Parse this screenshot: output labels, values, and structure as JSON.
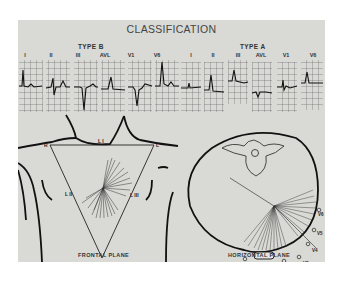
{
  "figure": {
    "title": "CLASSIFICATION",
    "type_b": {
      "label": "TYPE B",
      "leads": [
        "I",
        "II",
        "III",
        "AVL",
        "V1",
        "V6"
      ]
    },
    "type_a": {
      "label": "TYPE A",
      "leads": [
        "I",
        "II",
        "III",
        "AVL",
        "V1",
        "V6"
      ]
    },
    "frontal_plane": {
      "label": "FRONTAL PLANE",
      "vertex_labels": {
        "right": "R",
        "left": "L",
        "foot": "VF"
      },
      "side_labels": {
        "top": "L I",
        "left": "L II",
        "right": "L III"
      }
    },
    "horizontal_plane": {
      "label": "HORIZONTAL PLANE",
      "electrodes": [
        "V1",
        "V2",
        "V3",
        "V4",
        "V5",
        "V6"
      ]
    }
  }
}
